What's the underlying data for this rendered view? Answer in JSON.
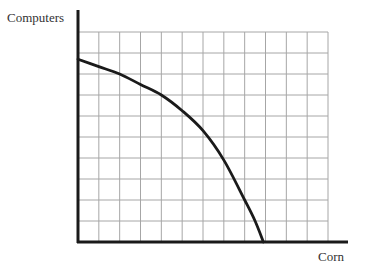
{
  "chart_data": {
    "type": "line",
    "title": "",
    "xlabel": "Corn",
    "ylabel": "Computers",
    "grid": true,
    "grid_columns": 12,
    "grid_rows": 10,
    "xlim": [
      0,
      12
    ],
    "ylim": [
      0,
      10
    ],
    "legend": "none",
    "tick_labels": false,
    "series": [
      {
        "name": "Production possibilities frontier",
        "x": [
          0,
          1,
          2,
          3,
          4,
          5,
          6,
          7,
          8,
          8.5,
          8.9
        ],
        "y": [
          8.7,
          8.35,
          8.0,
          7.5,
          7.0,
          6.25,
          5.3,
          3.9,
          2.0,
          1.0,
          0
        ]
      }
    ],
    "colors": {
      "curve": "#1a1a1a",
      "axis": "#1a1a1a",
      "grid": "#a6a6a6",
      "text": "#333333"
    }
  }
}
